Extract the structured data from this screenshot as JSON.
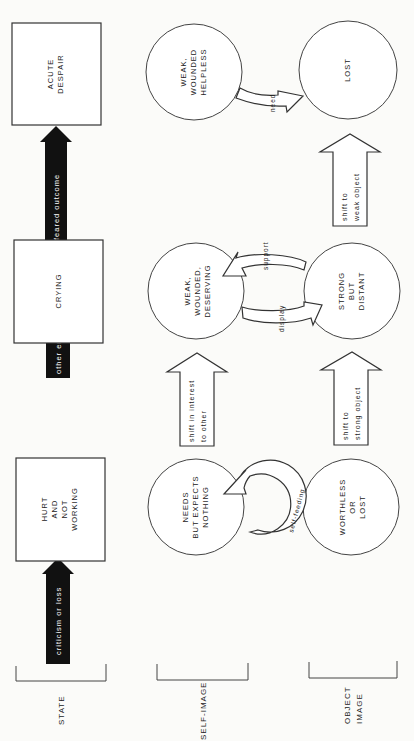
{
  "rows": {
    "state": "STATE",
    "self_image": "SELF-IMAGE",
    "object_image": [
      "OBJECT",
      "IMAGE"
    ]
  },
  "states": [
    {
      "lines": [
        "HURT",
        "AND",
        "NOT",
        "WORKING"
      ]
    },
    {
      "lines": [
        "CRYING"
      ]
    },
    {
      "lines": [
        "ACUTE",
        "DESPAIR"
      ]
    }
  ],
  "state_arrows": [
    {
      "label": "criticism or loss"
    },
    {
      "label": "other enters"
    },
    {
      "label": "feared outcome"
    }
  ],
  "self_images": [
    {
      "lines": [
        "NEEDS",
        "BUT EXPECTS",
        "NOTHING"
      ]
    },
    {
      "lines": [
        "WEAK,",
        "WOUNDED,",
        "DESERVING"
      ]
    },
    {
      "lines": [
        "WEAK,",
        "WOUNDED",
        "HELPLESS"
      ]
    }
  ],
  "object_images": [
    {
      "lines": [
        "WORTHLESS",
        "OR",
        "LOST"
      ]
    },
    {
      "lines": [
        "STRONG",
        "BUT",
        "DISTANT"
      ]
    },
    {
      "lines": [
        "LOST"
      ]
    }
  ],
  "transitions": {
    "self_feeding": "self-feeding",
    "support": "support",
    "display": "display",
    "need": "need",
    "shift_interest": [
      "shift in interest",
      "to other"
    ],
    "shift_strong": [
      "shift to",
      "strong object"
    ],
    "shift_weak": [
      "shift to",
      "weak object"
    ]
  }
}
